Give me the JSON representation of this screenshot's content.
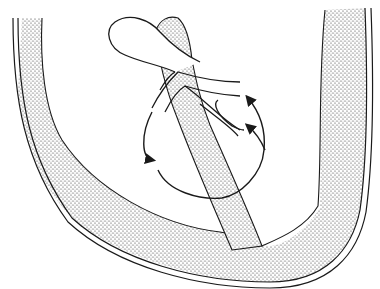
{
  "figure": {
    "width": 380,
    "height": 289,
    "background": "#ffffff",
    "ink_color": "#1a1a1a",
    "stipple_color": "#333333",
    "labels": [],
    "elements": [
      "outer-wall-band",
      "inner-stippled-column",
      "bulb-sac",
      "branching-ducts",
      "circulation-loop-arrows"
    ],
    "arrows": [
      {
        "position": "left-lower",
        "direction": "down"
      },
      {
        "position": "right-upper",
        "direction": "up"
      },
      {
        "position": "right-middle",
        "direction": "up"
      }
    ]
  }
}
